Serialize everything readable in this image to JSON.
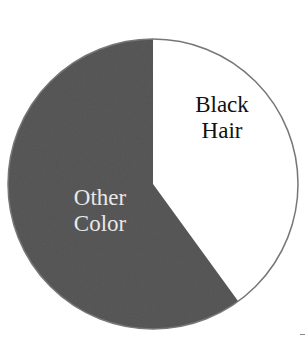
{
  "chart_data": {
    "type": "pie",
    "title": "",
    "slices": [
      {
        "label": "Black Hair",
        "value": 40,
        "color": "#ffffff",
        "label_color": "#111111"
      },
      {
        "label": "Other Color",
        "value": 60,
        "color": "#5a5a5a",
        "label_color": "#e8e8e8"
      }
    ],
    "start_angle_deg": 0,
    "direction": "clockwise",
    "legend": "none (labels inside slices)"
  },
  "labels": {
    "black_line1": "Black",
    "black_line2": "Hair",
    "other_line1": "Other",
    "other_line2": "Color"
  }
}
